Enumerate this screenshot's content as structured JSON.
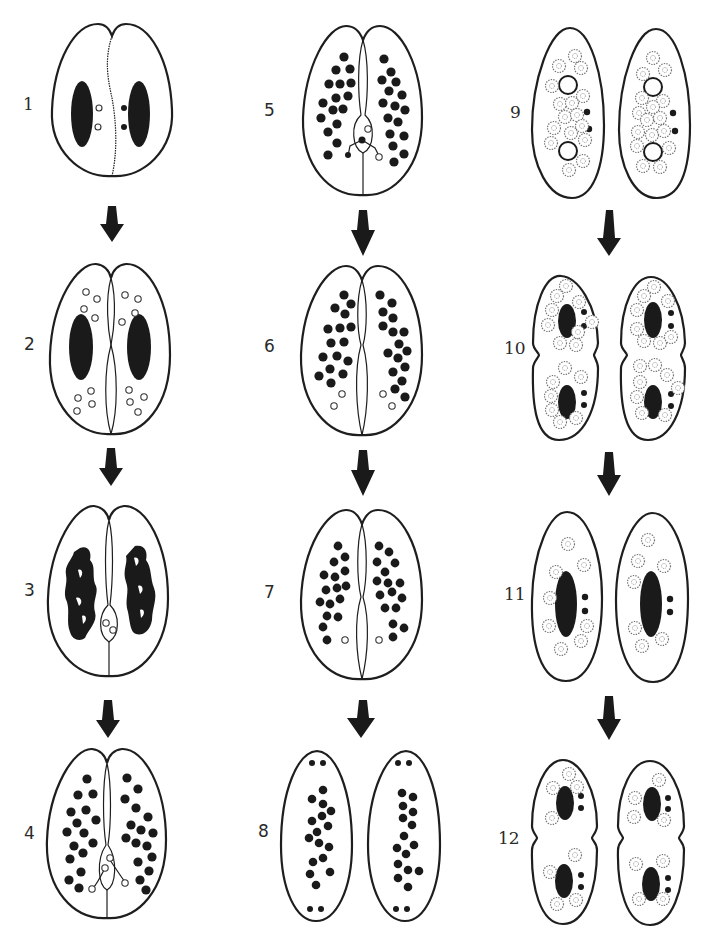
{
  "figure": {
    "colors": {
      "ink": "#1a1a1a",
      "background": "#ffffff",
      "fragment": "#777777"
    }
  },
  "legend_semantics": {
    "macro": "macronucleus (large dark oval)",
    "micro_solid": "micronucleus (small filled dot)",
    "micro_open": "degenerating/haploid nucleus (small open circle)",
    "frag": "macronuclear fragment (stippled circle)"
  },
  "stages": [
    {
      "id": 1,
      "label": "1",
      "column": 1,
      "row": 1,
      "form": "conjugating pair",
      "description": "Two cells joined; each with macronucleus and two micronuclei"
    },
    {
      "id": 2,
      "label": "2",
      "column": 1,
      "row": 2,
      "form": "conjugating pair",
      "description": "Meiosis produces haploid nuclei"
    },
    {
      "id": 3,
      "label": "3",
      "column": 1,
      "row": 3,
      "form": "conjugating pair",
      "description": "Macronucleus fragments; two nuclei in bridge"
    },
    {
      "id": 4,
      "label": "4",
      "column": 1,
      "row": 4,
      "form": "conjugating pair",
      "description": "Exchange of migratory nuclei"
    },
    {
      "id": 5,
      "label": "5",
      "column": 2,
      "row": 1,
      "form": "conjugating pair",
      "description": "Fusion of gametic nuclei"
    },
    {
      "id": 6,
      "label": "6",
      "column": 2,
      "row": 2,
      "form": "conjugating pair",
      "description": "Fragments dispersed; open nuclei"
    },
    {
      "id": 7,
      "label": "7",
      "column": 2,
      "row": 3,
      "form": "conjugating pair",
      "description": "Cells beginning separation"
    },
    {
      "id": 8,
      "label": "8",
      "column": 2,
      "row": 4,
      "form": "exconjugants",
      "description": "Separated exconjugants with nuclei at poles"
    },
    {
      "id": 9,
      "label": "9",
      "column": 3,
      "row": 1,
      "form": "exconjugants",
      "description": "New macronuclear anlagen (open rings) and fragments"
    },
    {
      "id": 10,
      "label": "10",
      "column": 3,
      "row": 2,
      "form": "dividing cells",
      "description": "First division of exconjugants"
    },
    {
      "id": 11,
      "label": "11",
      "column": 3,
      "row": 3,
      "form": "daughter cells",
      "description": "Each cell with one macronucleus and two micronuclei"
    },
    {
      "id": 12,
      "label": "12",
      "column": 3,
      "row": 4,
      "form": "dividing cells",
      "description": "Second division"
    }
  ],
  "arrows": [
    {
      "from": 1,
      "to": 2,
      "direction": "down"
    },
    {
      "from": 2,
      "to": 3,
      "direction": "down"
    },
    {
      "from": 3,
      "to": 4,
      "direction": "down"
    },
    {
      "from": 5,
      "to": 6,
      "direction": "down"
    },
    {
      "from": 6,
      "to": 7,
      "direction": "down"
    },
    {
      "from": 7,
      "to": 8,
      "direction": "down"
    },
    {
      "from": 9,
      "to": 10,
      "direction": "down"
    },
    {
      "from": 10,
      "to": 11,
      "direction": "down"
    },
    {
      "from": 11,
      "to": 12,
      "direction": "down"
    }
  ]
}
